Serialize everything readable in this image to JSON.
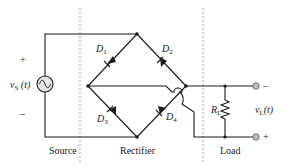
{
  "diagram": {
    "type": "circuit-schematic",
    "sections": [
      {
        "label": "Source"
      },
      {
        "label": "Rectifier"
      },
      {
        "label": "Load"
      }
    ],
    "source": {
      "label_main": "v",
      "label_sub": "S",
      "label_arg": " (t)",
      "plus": "+",
      "minus": "–",
      "symbol": "ac-sine"
    },
    "diodes": [
      {
        "id": "D1",
        "main": "D",
        "sub": "1"
      },
      {
        "id": "D2",
        "main": "D",
        "sub": "2"
      },
      {
        "id": "D3",
        "main": "D",
        "sub": "3"
      },
      {
        "id": "D4",
        "main": "D",
        "sub": "4"
      }
    ],
    "load": {
      "resistor_main": "R",
      "resistor_sub": "L",
      "voltage_main": "v",
      "voltage_sub": "L",
      "voltage_arg": "(t)",
      "top_terminal": "–",
      "bottom_terminal": "+"
    },
    "colors": {
      "wire": "#1a1a1a",
      "dash": "#8a8a8a",
      "source_fill": "#e6e6e6",
      "terminal_fill": "#bdbdbd"
    }
  }
}
